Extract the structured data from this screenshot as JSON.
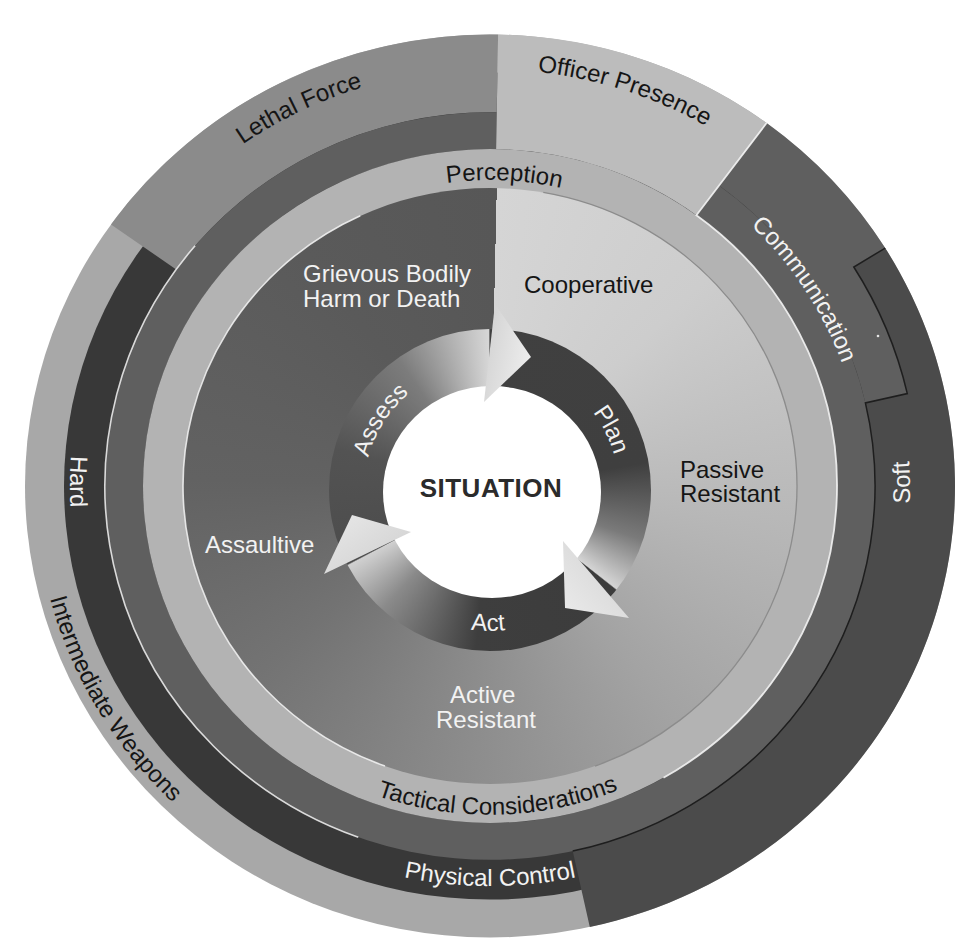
{
  "diagram": {
    "center_label": "SITUATION",
    "cycle": {
      "assess": "Assess",
      "plan": "Plan",
      "act": "Act"
    },
    "subject_behaviour": {
      "grievous_line1": "Grievous Bodily",
      "grievous_line2": "Harm or Death",
      "cooperative": "Cooperative",
      "passive_line1": "Passive",
      "passive_line2": "Resistant",
      "active_line1": "Active",
      "active_line2": "Resistant",
      "assaultive": "Assaultive"
    },
    "perception_ring": {
      "top": "Perception",
      "bottom": "Tactical Considerations"
    },
    "force_options": {
      "lethal_force": "Lethal Force",
      "officer_presence": "Officer Presence",
      "communication": "Communication",
      "soft": "Soft",
      "hard": "Hard",
      "intermediate_weapons": "Intermediate Weapons",
      "physical_control": "Physical Control"
    }
  },
  "colors": {
    "intermediate_weapons": "#a8a8a8",
    "hard_physical_control": "#383838",
    "soft": "#4b4b4b",
    "lethal_force": "#8b8b8b",
    "communication_ring": "#5f5f5f",
    "officer_presence": "#bcbcbc",
    "perception_ring": "#b3b3b3",
    "center": "#ffffff",
    "arrow_head": "#dcdcdc"
  }
}
